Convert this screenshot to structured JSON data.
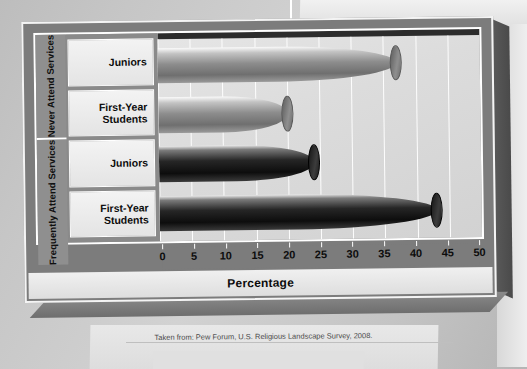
{
  "chart_data": {
    "type": "bar",
    "orientation": "horizontal",
    "title": "",
    "xlabel": "Percentage",
    "ylabel": "",
    "xlim": [
      0,
      50
    ],
    "xticks": [
      0,
      5,
      10,
      15,
      20,
      25,
      30,
      35,
      40,
      45,
      50
    ],
    "grid": true,
    "legend": "none",
    "groups": [
      {
        "label": "Never\nAttend\nServices",
        "label_flat": "Never Attend Services",
        "style": "light",
        "bars": [
          {
            "category": "Juniors",
            "value": 37
          },
          {
            "category": "First-Year\nStudents",
            "value": 20
          }
        ]
      },
      {
        "label": "Frequently\nAttend\nServices",
        "label_flat": "Frequently Attend Services",
        "style": "dark",
        "bars": [
          {
            "category": "Juniors",
            "value": 24
          },
          {
            "category": "First-Year\nStudents",
            "value": 43
          }
        ]
      }
    ],
    "categories": [
      "Never Attend Services - Juniors",
      "Never Attend Services - First-Year Students",
      "Frequently Attend Services - Juniors",
      "Frequently Attend Services - First-Year Students"
    ],
    "values": [
      37,
      20,
      24,
      43
    ]
  },
  "caption": "Taken from: Pew Forum, U.S. Religious Landscape Survey, 2008.",
  "colors": {
    "frame": "#7c7c7c",
    "plot_background": "#dcdcdc",
    "gridline": "#fdfdfd",
    "bar_light": "#8d8d8d",
    "bar_dark": "#0d0d0d",
    "text": "#0c0c0c"
  }
}
